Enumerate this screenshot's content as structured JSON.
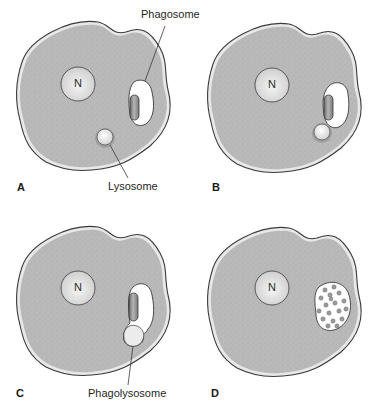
{
  "figure": {
    "colors": {
      "cytoplasm": "#b8b8b8",
      "cytoplasm_stipple": "#9a9a9a",
      "membrane_outline": "#3a3a3a",
      "membrane_rim": "#e6e6e6",
      "nucleus_fill": "#e4e4e4",
      "vacuole_fill": "#ffffff",
      "particle_fill": "#8a8a8a",
      "lysosome_fill": "#f0f0f0",
      "lysosome_ring": "#7a7a7a"
    },
    "panels": [
      {
        "letter": "A",
        "nucleus_label": "N",
        "callouts": [
          {
            "label": "Phagosome"
          },
          {
            "label": "Lysosome"
          }
        ]
      },
      {
        "letter": "B",
        "nucleus_label": "N",
        "callouts": []
      },
      {
        "letter": "C",
        "nucleus_label": "N",
        "callouts": [
          {
            "label": "Phagolysosome"
          }
        ]
      },
      {
        "letter": "D",
        "nucleus_label": "N",
        "callouts": []
      }
    ]
  }
}
